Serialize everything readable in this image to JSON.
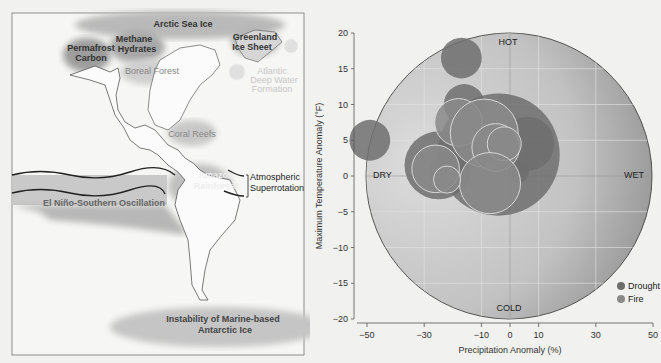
{
  "map": {
    "labels": {
      "arctic_sea_ice": "Arctic Sea Ice",
      "methane_hydrates_1": "Methane",
      "methane_hydrates_2": "Hydrates",
      "permafrost_1": "Permafrost",
      "permafrost_2": "Carbon",
      "greenland_1": "Greenland",
      "greenland_2": "Ice Sheet",
      "boreal_forest": "Boreal Forest",
      "atlantic_1": "Atlantic",
      "atlantic_2": "Deep Water",
      "atlantic_3": "Formation",
      "coral_reefs": "Coral Reefs",
      "amazon_1": "Amazon",
      "amazon_2": "Rainforest",
      "atmospheric_1": "Atmospheric",
      "atmospheric_2": "Superrotation",
      "enso": "El Niño-Southern Oscillation",
      "antarctic_1": "Instability of Marine-based",
      "antarctic_2": "Antarctic Ice"
    }
  },
  "chart_data": {
    "type": "scatter",
    "title": "",
    "xlabel": "Precipitation Anomaly (%)",
    "ylabel": "Maximum Temperature Anomaly (°F)",
    "xlim": [
      -50,
      50
    ],
    "ylim": [
      -20,
      20
    ],
    "xticks": [
      -50,
      -30,
      -10,
      0,
      10,
      30,
      50
    ],
    "yticks": [
      20,
      15,
      10,
      5,
      0,
      -5,
      -10,
      -15,
      -20
    ],
    "quadrant_labels": {
      "top": "HOT",
      "bottom": "COLD",
      "left": "DRY",
      "right": "WET"
    },
    "legend": [
      {
        "name": "Drought",
        "color": "#6e6e6e"
      },
      {
        "name": "Fire",
        "color": "#8a8a8a"
      }
    ],
    "legend_position": "lower right",
    "grid": true,
    "series": [
      {
        "name": "Drought",
        "points": [
          {
            "x": -17,
            "y": 16.5,
            "r": 3
          },
          {
            "x": -49,
            "y": 5,
            "r": 3
          },
          {
            "x": -16,
            "y": 10,
            "r": 3
          },
          {
            "x": 6,
            "y": 4.5,
            "r": 4
          },
          {
            "x": -25,
            "y": 1.5,
            "r": 5
          },
          {
            "x": -21,
            "y": 0.5,
            "r": 3
          },
          {
            "x": -4,
            "y": 3,
            "r": 9
          },
          {
            "x": 3,
            "y": 0.5,
            "r": 1.5
          }
        ]
      },
      {
        "name": "Fire",
        "points": [
          {
            "x": -18,
            "y": 7.5,
            "r": 3.5
          },
          {
            "x": -9,
            "y": 6,
            "r": 5
          },
          {
            "x": -5,
            "y": 4,
            "r": 3.5
          },
          {
            "x": -2,
            "y": 4.5,
            "r": 2.5
          },
          {
            "x": -26,
            "y": 1,
            "r": 3.5
          },
          {
            "x": -7,
            "y": -1,
            "r": 4.5
          },
          {
            "x": -22,
            "y": -0.5,
            "r": 2
          }
        ]
      }
    ]
  }
}
